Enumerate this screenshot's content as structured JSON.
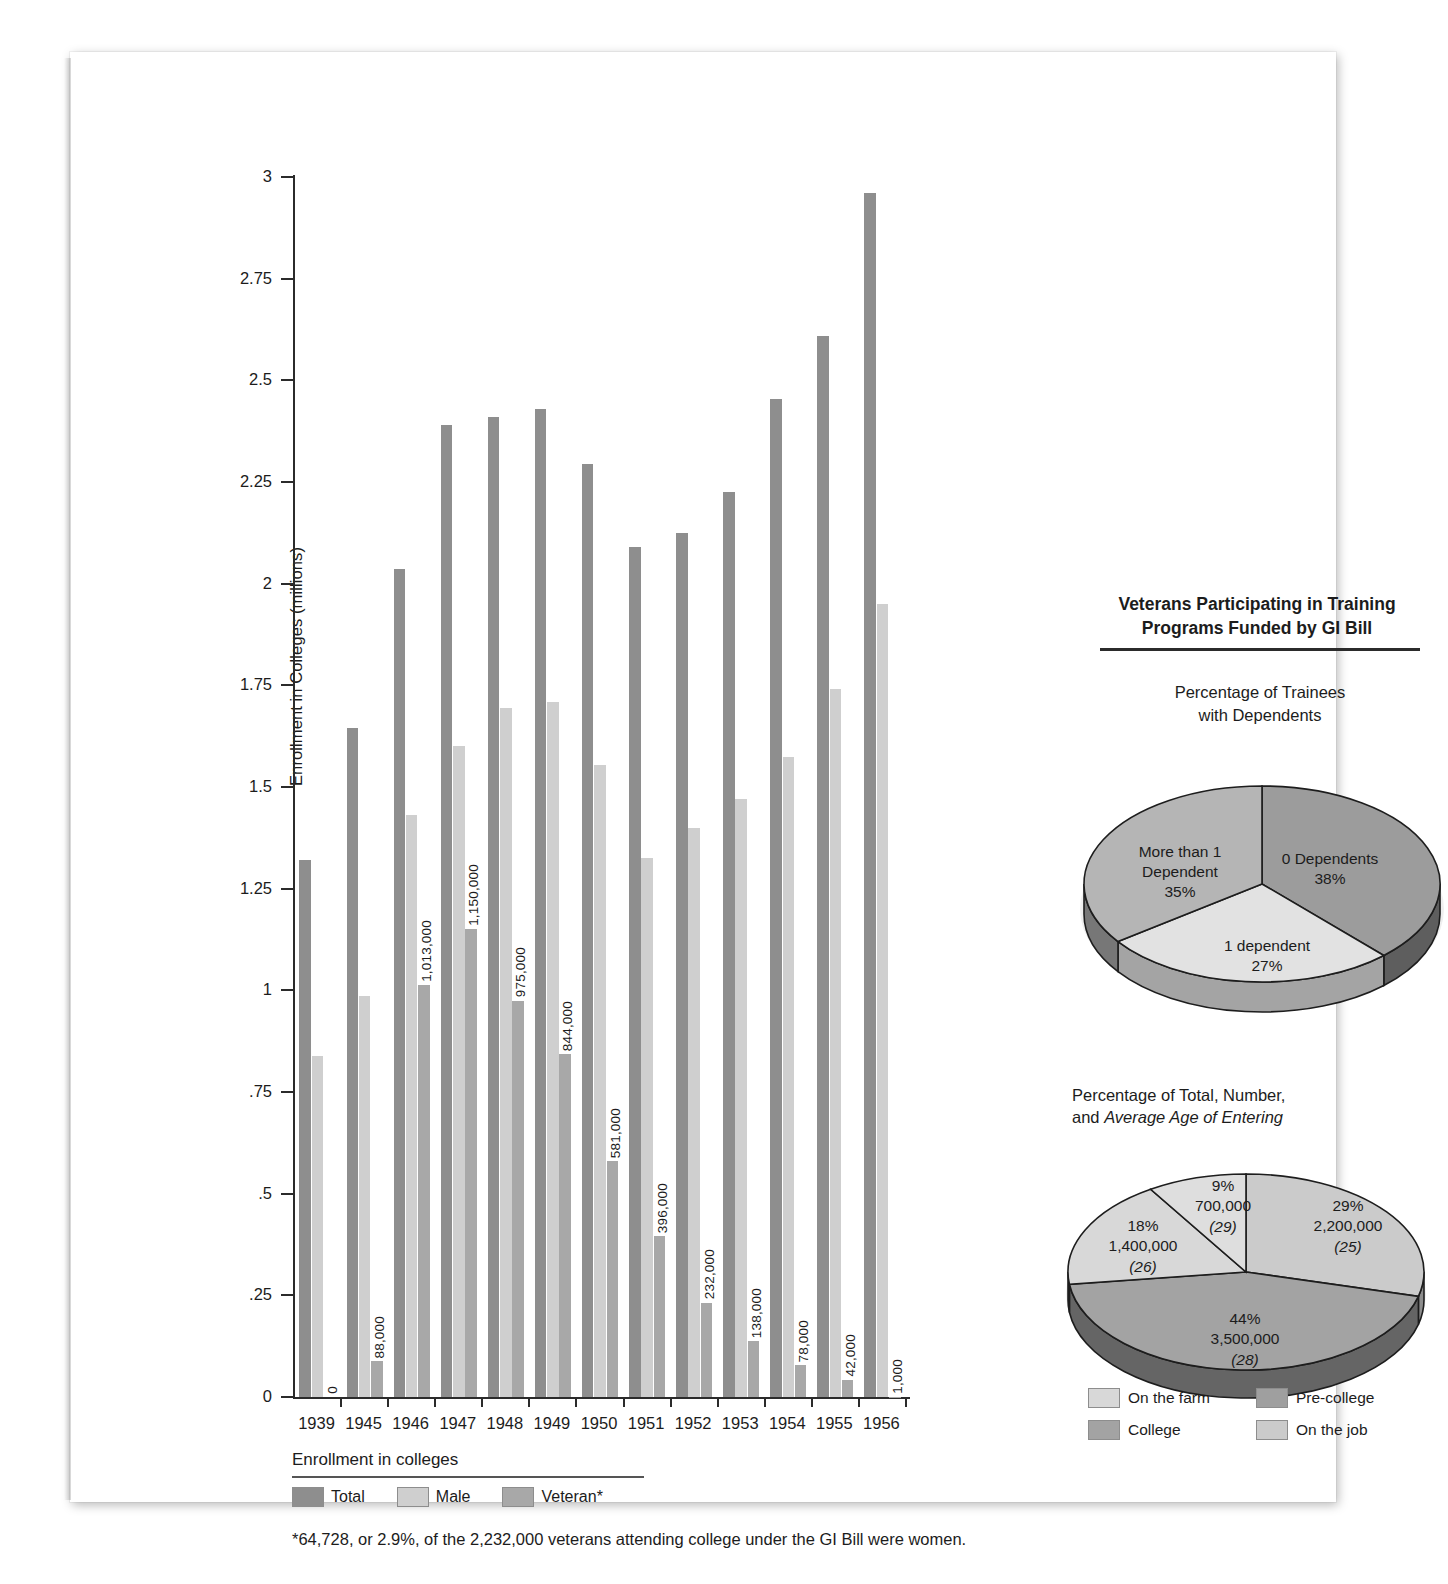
{
  "chart_data": [
    {
      "type": "bar",
      "title": "",
      "xlabel": "",
      "ylabel": "Enrollment in Colleges (millions)",
      "ylim": [
        0,
        3
      ],
      "yticks": [
        "0",
        ".25",
        ".5",
        ".75",
        "1",
        "1.25",
        "1.5",
        "1.75",
        "2",
        "2.25",
        "2.5",
        "2.75",
        "3"
      ],
      "grid": false,
      "categories": [
        "1939",
        "1945",
        "1946",
        "1947",
        "1948",
        "1949",
        "1950",
        "1951",
        "1952",
        "1953",
        "1954",
        "1955",
        "1956"
      ],
      "series": [
        {
          "name": "Total",
          "values": [
            1.32,
            1.645,
            2.035,
            2.39,
            2.41,
            2.43,
            2.295,
            2.09,
            2.125,
            2.225,
            2.455,
            2.61,
            2.96
          ]
        },
        {
          "name": "Male",
          "values": [
            0.838,
            0.985,
            1.43,
            1.6,
            1.695,
            1.71,
            1.555,
            1.325,
            1.4,
            1.47,
            1.575,
            1.74,
            1.95
          ]
        },
        {
          "name": "Veteran*",
          "values": [
            0.0,
            0.088,
            1.013,
            1.15,
            0.975,
            0.844,
            0.581,
            0.396,
            0.232,
            0.138,
            0.078,
            0.042,
            0.001
          ]
        }
      ],
      "value_labels": [
        "0",
        "88,000",
        "1,013,000",
        "1,150,000",
        "975,000",
        "844,000",
        "581,000",
        "396,000",
        "232,000",
        "138,000",
        "78,000",
        "42,000",
        "1,000"
      ],
      "legend_title": "Enrollment in colleges",
      "legend_position": "bottom-left",
      "footnote": "*64,728, or 2.9%, of the 2,232,000 veterans attending college under the GI Bill were women."
    },
    {
      "type": "pie",
      "title": "Percentage of Trainees\nwith Dependents",
      "title_line1": "Percentage of Trainees",
      "title_line2": "with Dependents",
      "labels": [
        "0 Dependents",
        "1 dependent",
        "More than 1 Dependent"
      ],
      "values": [
        38,
        27,
        35
      ],
      "value_text": [
        "38%",
        "27%",
        "35%"
      ],
      "colors": [
        "#9c9c9c",
        "#e2e2e2",
        "#b5b5b5"
      ],
      "legend_position": "none"
    },
    {
      "type": "pie",
      "title": "Percentage of Total, Number, and Average Age of Entering",
      "title_line1": "Percentage of Total, Number,",
      "title_line2_plain": "and ",
      "title_line2_italic": "Average Age of Entering",
      "labels": [
        "On the job",
        "College",
        "On the farm",
        "Pre-college"
      ],
      "values": [
        29,
        44,
        18,
        9
      ],
      "value_text": [
        "29%",
        "44%",
        "18%",
        "9%"
      ],
      "number_text": [
        "2,200,000",
        "3,500,000",
        "1,400,000",
        "700,000"
      ],
      "age_text": [
        "(25)",
        "(28)",
        "(26)",
        "(29)"
      ],
      "colors": [
        "#cbcbcb",
        "#a3a3a3",
        "#d8d8d8",
        "#dedede"
      ],
      "legend_position": "bottom"
    }
  ],
  "right_panel": {
    "heading_line1": "Veterans Participating in Training",
    "heading_line2": "Programs Funded by GI Bill",
    "pie1": {
      "sub_line1": "Percentage of Trainees",
      "sub_line2": "with Dependents",
      "slice_a_label": "0 Dependents",
      "slice_a_value": "38%",
      "slice_b_label": "1 dependent",
      "slice_b_value": "27%",
      "slice_c_line1": "More than 1",
      "slice_c_line2": "Dependent",
      "slice_c_value": "35%"
    },
    "pie2": {
      "sub_line1": "Percentage of Total, Number,",
      "sub_line2_plain": "and ",
      "sub_line2_italic": "Average Age of Entering",
      "s1_pct": "29%",
      "s1_num": "2,200,000",
      "s1_age": "(25)",
      "s2_pct": "44%",
      "s2_num": "3,500,000",
      "s2_age": "(28)",
      "s3_pct": "18%",
      "s3_num": "1,400,000",
      "s3_age": "(26)",
      "s4_pct": "9%",
      "s4_num": "700,000",
      "s4_age": "(29)",
      "legend": [
        {
          "label": "On the farm",
          "color": "#d8d8d8"
        },
        {
          "label": "Pre-college",
          "color": "#9f9f9f"
        },
        {
          "label": "College",
          "color": "#a3a3a3"
        },
        {
          "label": "On the job",
          "color": "#cbcbcb"
        }
      ]
    }
  },
  "bar_legend": {
    "title": "Enrollment in colleges",
    "items": [
      {
        "label": "Total",
        "color": "#8e8e8e"
      },
      {
        "label": "Male",
        "color": "#cfcfcf"
      },
      {
        "label": "Veteran*",
        "color": "#a8a8a8"
      }
    ],
    "footnote": "*64,728, or 2.9%, of the 2,232,000 veterans attending college under the GI Bill were women."
  },
  "axis": {
    "y_title": "Enrollment in Colleges (millions)"
  }
}
